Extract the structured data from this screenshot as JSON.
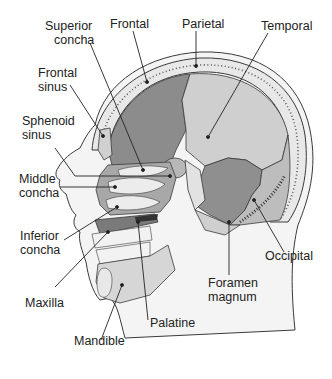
{
  "figure": {
    "colors": {
      "background": "#ffffff",
      "outline": "#3a3a3a",
      "frontal_bone": "#8c8c8c",
      "parietal_bone": "#c8c8c8",
      "temporal_bone": "#8f8f8f",
      "occipital_bone": "#bdbdbd",
      "skin": "#f4f4f4",
      "soft_tissue": "#d6d6d6",
      "spongy_bone": "#e8e8e8",
      "leader_line": "#222222"
    }
  },
  "labels": {
    "superior_concha": [
      "Superior",
      "concha"
    ],
    "frontal": [
      "Frontal"
    ],
    "parietal": [
      "Parietal"
    ],
    "temporal": [
      "Temporal"
    ],
    "frontal_sinus": [
      "Frontal",
      "sinus"
    ],
    "sphenoid_sinus": [
      "Sphenoid",
      "sinus"
    ],
    "middle_concha": [
      "Middle",
      "concha"
    ],
    "inferior_concha": [
      "Inferior",
      "concha"
    ],
    "maxilla": [
      "Maxilla"
    ],
    "mandible": [
      "Mandible"
    ],
    "palatine": [
      "Palatine"
    ],
    "foramen_magnum": [
      "Foramen",
      "magnum"
    ],
    "occipital": [
      "Occipital"
    ]
  }
}
